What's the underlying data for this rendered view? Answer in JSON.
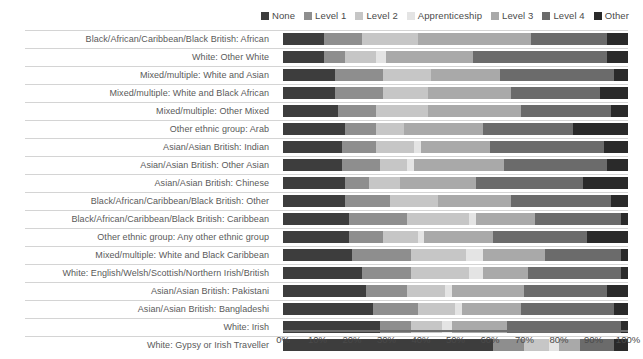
{
  "chart_data": {
    "type": "bar",
    "subtype": "stacked-horizontal-100pct",
    "title": "",
    "xlabel": "",
    "ylabel": "",
    "xlim": [
      0,
      100
    ],
    "grid": false,
    "legend_position": "top-right",
    "axis_tick_labels": [
      "0%",
      "10%",
      "20%",
      "30%",
      "40%",
      "50%",
      "60%",
      "70%",
      "80%",
      "90%",
      "100%"
    ],
    "axis_tick_values": [
      0,
      10,
      20,
      30,
      40,
      50,
      60,
      70,
      80,
      90,
      100
    ],
    "legend": [
      {
        "label": "None",
        "color": "#3d3d3d"
      },
      {
        "label": "Level 1",
        "color": "#8e8e8e"
      },
      {
        "label": "Level 2",
        "color": "#c6c6c6"
      },
      {
        "label": "Apprenticeship",
        "color": "#e4e4e4"
      },
      {
        "label": "Level 3",
        "color": "#a9a9a9"
      },
      {
        "label": "Level 4",
        "color": "#6b6b6b"
      },
      {
        "label": "Other",
        "color": "#2a2a2a"
      }
    ],
    "series": [
      {
        "name": "None",
        "color": "#3d3d3d"
      },
      {
        "name": "Level 1",
        "color": "#8e8e8e"
      },
      {
        "name": "Level 2",
        "color": "#c6c6c6"
      },
      {
        "name": "Apprenticeship",
        "color": "#e4e4e4"
      },
      {
        "name": "Level 3",
        "color": "#a9a9a9"
      },
      {
        "name": "Level 4",
        "color": "#6b6b6b"
      },
      {
        "name": "Other",
        "color": "#2a2a2a"
      }
    ],
    "categories": [
      "Black/African/Caribbean/Black British: African",
      "White: Other White",
      "Mixed/multiple: White and Asian",
      "Mixed/multiple: White and Black African",
      "Mixed/multiple: Other Mixed",
      "Other ethnic group: Arab",
      "Asian/Asian British: Indian",
      "Asian/Asian British: Other Asian",
      "Asian/Asian British: Chinese",
      "Black/African/Caribbean/Black British: Other",
      "Black/African/Caribbean/Black British: Caribbean",
      "Other ethnic group: Any other ethnic group",
      "Mixed/multiple: White and Black Caribbean",
      "White: English/Welsh/Scottish/Northern Irish/British",
      "Asian/Asian British: Pakistani",
      "Asian/Asian British: Bangladeshi",
      "White: Irish",
      "White: Gypsy or Irish Traveller"
    ],
    "rows": [
      {
        "category": "Black/African/Caribbean/Black British: African",
        "values": [
          12,
          11,
          16,
          0,
          33,
          22,
          6
        ]
      },
      {
        "category": "White: Other White",
        "values": [
          12,
          6,
          9,
          3,
          25,
          39,
          6
        ]
      },
      {
        "category": "Mixed/multiple: White and Asian",
        "values": [
          15,
          14,
          14,
          0,
          20,
          33,
          4
        ]
      },
      {
        "category": "Mixed/multiple: White and Black African",
        "values": [
          15,
          14,
          13,
          0,
          24,
          26,
          8
        ]
      },
      {
        "category": "Mixed/multiple: Other Mixed",
        "values": [
          16,
          11,
          15,
          0,
          27,
          26,
          5
        ]
      },
      {
        "category": "Other ethnic group: Arab",
        "values": [
          18,
          9,
          8,
          0,
          23,
          26,
          16
        ]
      },
      {
        "category": "Asian/Asian British: Indian",
        "values": [
          17,
          10,
          11,
          2,
          20,
          33,
          7
        ]
      },
      {
        "category": "Asian/Asian British: Other Asian",
        "values": [
          17,
          11,
          8,
          2,
          26,
          30,
          6
        ]
      },
      {
        "category": "Asian/Asian British: Chinese",
        "values": [
          18,
          7,
          9,
          0,
          22,
          31,
          13
        ]
      },
      {
        "category": "Black/African/Caribbean/Black British: Other",
        "values": [
          18,
          13,
          14,
          0,
          21,
          29,
          5
        ]
      },
      {
        "category": "Black/African/Caribbean/Black British: Caribbean",
        "values": [
          19,
          17,
          18,
          2,
          17,
          25,
          2
        ]
      },
      {
        "category": "Other ethnic group: Any other ethnic group",
        "values": [
          19,
          10,
          10,
          2,
          20,
          27,
          12
        ]
      },
      {
        "category": "Mixed/multiple: White and Black Caribbean",
        "values": [
          20,
          17,
          16,
          5,
          18,
          22,
          2
        ]
      },
      {
        "category": "White: English/Welsh/Scottish/Northern Irish/British",
        "values": [
          23,
          14,
          17,
          4,
          13,
          27,
          2
        ]
      },
      {
        "category": "Asian/Asian British: Pakistani",
        "values": [
          24,
          12,
          11,
          2,
          21,
          24,
          6
        ]
      },
      {
        "category": "Asian/Asian British: Bangladeshi",
        "values": [
          26,
          13,
          11,
          2,
          17,
          27,
          4
        ]
      },
      {
        "category": "White: Irish",
        "values": [
          28,
          9,
          9,
          3,
          16,
          33,
          2
        ]
      },
      {
        "category": "White: Gypsy or Irish Traveller",
        "values": [
          61,
          9,
          7,
          3,
          6,
          10,
          4
        ]
      }
    ]
  }
}
